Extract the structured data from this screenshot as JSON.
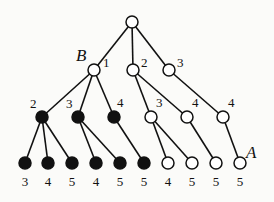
{
  "diagram": {
    "type": "tree",
    "nodes": [
      {
        "id": "root",
        "x": 132,
        "y": 22,
        "fill": "white"
      },
      {
        "id": "n1",
        "x": 94,
        "y": 70,
        "fill": "white",
        "label": "1",
        "label_dx": 9,
        "label_dy": -3,
        "tag": "B"
      },
      {
        "id": "n2",
        "x": 133,
        "y": 70,
        "fill": "white",
        "label": "2",
        "label_dx": 8,
        "label_dy": -3
      },
      {
        "id": "n3",
        "x": 169,
        "y": 70,
        "fill": "white",
        "label": "3",
        "label_dx": 8,
        "label_dy": -3
      },
      {
        "id": "n12",
        "x": 42,
        "y": 117,
        "fill": "black",
        "label": "2",
        "label_dx": -12,
        "label_dy": -9
      },
      {
        "id": "n13",
        "x": 78,
        "y": 117,
        "fill": "black",
        "label": "3",
        "label_dx": -12,
        "label_dy": -9
      },
      {
        "id": "n14",
        "x": 114,
        "y": 117,
        "fill": "black",
        "label": "4",
        "label_dx": 3,
        "label_dy": -10
      },
      {
        "id": "n23",
        "x": 151,
        "y": 117,
        "fill": "white",
        "label": "3",
        "label_dx": 5,
        "label_dy": -10
      },
      {
        "id": "n24",
        "x": 187,
        "y": 117,
        "fill": "white",
        "label": "4",
        "label_dx": 5,
        "label_dy": -10
      },
      {
        "id": "n34",
        "x": 223,
        "y": 117,
        "fill": "white",
        "label": "4",
        "label_dx": 5,
        "label_dy": -10
      },
      {
        "id": "l1",
        "x": 25,
        "y": 163,
        "fill": "black",
        "label": "3"
      },
      {
        "id": "l2",
        "x": 48,
        "y": 163,
        "fill": "black",
        "label": "4"
      },
      {
        "id": "l3",
        "x": 72,
        "y": 163,
        "fill": "black",
        "label": "5"
      },
      {
        "id": "l4",
        "x": 96,
        "y": 163,
        "fill": "black",
        "label": "4"
      },
      {
        "id": "l5",
        "x": 120,
        "y": 163,
        "fill": "black",
        "label": "5"
      },
      {
        "id": "l6",
        "x": 144,
        "y": 163,
        "fill": "black",
        "label": "5"
      },
      {
        "id": "l7",
        "x": 168,
        "y": 163,
        "fill": "white",
        "label": "4"
      },
      {
        "id": "l8",
        "x": 192,
        "y": 163,
        "fill": "white",
        "label": "5"
      },
      {
        "id": "l9",
        "x": 216,
        "y": 163,
        "fill": "white",
        "label": "5"
      },
      {
        "id": "l10",
        "x": 240,
        "y": 163,
        "fill": "white",
        "label": "5",
        "tag": "A"
      }
    ],
    "edges": [
      [
        "root",
        "n1"
      ],
      [
        "root",
        "n2"
      ],
      [
        "root",
        "n3"
      ],
      [
        "n1",
        "n12"
      ],
      [
        "n1",
        "n13"
      ],
      [
        "n1",
        "n14"
      ],
      [
        "n2",
        "n23"
      ],
      [
        "n2",
        "n24"
      ],
      [
        "n3",
        "n34"
      ],
      [
        "n12",
        "l1"
      ],
      [
        "n12",
        "l2"
      ],
      [
        "n12",
        "l3"
      ],
      [
        "n13",
        "l4"
      ],
      [
        "n13",
        "l5"
      ],
      [
        "n14",
        "l6"
      ],
      [
        "n23",
        "l7"
      ],
      [
        "n23",
        "l8"
      ],
      [
        "n24",
        "l9"
      ],
      [
        "n34",
        "l10"
      ]
    ],
    "tags": {
      "B": {
        "text": "B",
        "x": 76,
        "y": 61
      },
      "A": {
        "text": "A",
        "x": 246,
        "y": 158
      }
    },
    "node_radius": 6,
    "colors": {
      "stroke": "#111111",
      "filled": "#111111",
      "empty": "#ffffff",
      "background": "#fbfbf9"
    }
  }
}
